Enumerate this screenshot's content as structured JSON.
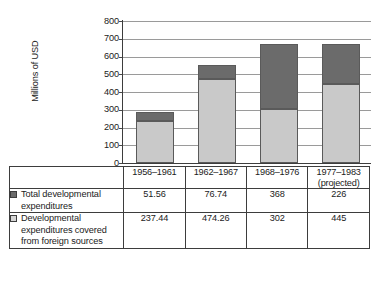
{
  "chart_data": {
    "type": "bar",
    "subtype": "stacked-bar",
    "title": "",
    "xlabel": "",
    "ylabel": "Millions of USD",
    "ylim": [
      0,
      800
    ],
    "ytick_step": 100,
    "yticks": [
      "800",
      "700",
      "600",
      "500",
      "400",
      "300",
      "200",
      "100",
      "0"
    ],
    "grid": true,
    "legend_position": "table-row-headers",
    "categories": [
      "1956–1961",
      "1962–1967",
      "1968–1976",
      "1977–1983 (projected)"
    ],
    "series": [
      {
        "name": "Total developmental expenditures",
        "color": "#6b6b6b",
        "values": [
          51.56,
          76.74,
          368,
          226
        ]
      },
      {
        "name": "Developmental expenditures covered from foreign sources",
        "color": "#c9c9c9",
        "values": [
          237.44,
          474.26,
          302,
          445
        ]
      }
    ],
    "stack_totals": [
      289,
      551,
      670,
      671
    ]
  },
  "axis": {
    "y_title": "Millions of USD",
    "ticks": [
      {
        "label": "800",
        "value": 800
      },
      {
        "label": "700",
        "value": 700
      },
      {
        "label": "600",
        "value": 600
      },
      {
        "label": "500",
        "value": 500
      },
      {
        "label": "400",
        "value": 400
      },
      {
        "label": "300",
        "value": 300
      },
      {
        "label": "200",
        "value": 200
      },
      {
        "label": "100",
        "value": 100
      },
      {
        "label": "0",
        "value": 0
      }
    ]
  },
  "table": {
    "period_row": [
      {
        "line1": "1956–1961",
        "line2": ""
      },
      {
        "line1": "1962–1967",
        "line2": ""
      },
      {
        "line1": "1968–1976",
        "line2": ""
      },
      {
        "line1": "1977–1983",
        "line2": "(projected)"
      }
    ],
    "rows": [
      {
        "swatch": "dark-gray-square-icon",
        "label": "Total developmental expenditures",
        "values": [
          "51.56",
          "76.74",
          "368",
          "226"
        ]
      },
      {
        "swatch": "light-gray-square-icon",
        "label": "Developmental expenditures covered from foreign sources",
        "values": [
          "237.44",
          "474.26",
          "302",
          "445"
        ]
      }
    ]
  },
  "colors": {
    "series_dark": "#6b6b6b",
    "series_light": "#c9c9c9",
    "gridline": "#9a9a9a",
    "axis": "#3d3d3d",
    "text": "#1b1b1b",
    "background": "#ffffff"
  }
}
